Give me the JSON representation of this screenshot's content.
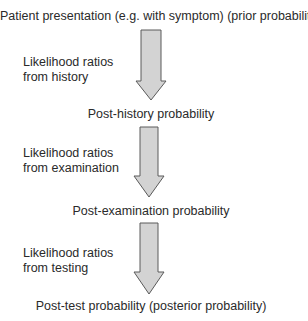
{
  "diagram": {
    "stages": [
      {
        "id": "prior",
        "text": "Patient presentation (e.g. with symptom) (prior probability)"
      },
      {
        "id": "post-history",
        "text": "Post-history probability"
      },
      {
        "id": "post-examination",
        "text": "Post-examination probability"
      },
      {
        "id": "post-test",
        "text": "Post-test probability (posterior probability)"
      }
    ],
    "steps": [
      {
        "line1": "Likelihood ratios",
        "line2": "from history"
      },
      {
        "line1": "Likelihood ratios",
        "line2": "from examination"
      },
      {
        "line1": "Likelihood ratios",
        "line2": "from testing"
      }
    ],
    "colors": {
      "arrow_fill": "#d3d3d3",
      "arrow_stroke": "#5a5a5a",
      "text": "#2a2a2a"
    }
  }
}
